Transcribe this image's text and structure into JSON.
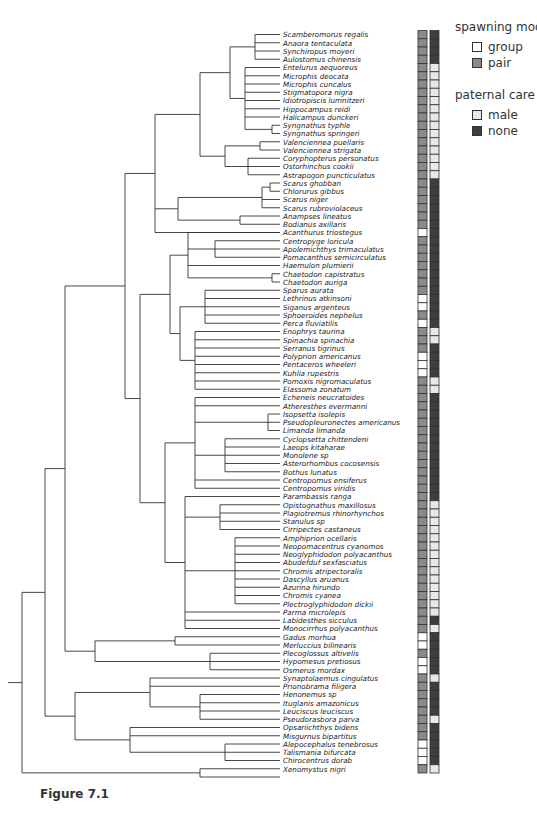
{
  "legend": {
    "spawning_title": "spawning mode",
    "spawning_items": [
      {
        "label": "group",
        "color": "#ffffff"
      },
      {
        "label": "pair",
        "color": "#8a8a8a"
      }
    ],
    "care_title": "paternal care",
    "care_items": [
      {
        "label": "male",
        "color": "#e8e8e8"
      },
      {
        "label": "none",
        "color": "#3d3d3d"
      }
    ]
  },
  "caption": "Figure 7.1",
  "colors": {
    "group": "#ffffff",
    "pair": "#8a8a8a",
    "male": "#e8e8e8",
    "none": "#3d3d3d",
    "line": "#333333"
  },
  "taxa": [
    {
      "name": "Scamberomorus regalis",
      "spawn": "pair",
      "care": "none"
    },
    {
      "name": "Anaora tentaculata",
      "spawn": "pair",
      "care": "none"
    },
    {
      "name": "Synchiropus moyeri",
      "spawn": "pair",
      "care": "none"
    },
    {
      "name": "Aulostomus chinensis",
      "spawn": "pair",
      "care": "none"
    },
    {
      "name": "Entelurus aequoreus",
      "spawn": "pair",
      "care": "male"
    },
    {
      "name": "Microphis deocata",
      "spawn": "pair",
      "care": "male"
    },
    {
      "name": "Microphis cuncalus",
      "spawn": "pair",
      "care": "male"
    },
    {
      "name": "Stigmatopora nigra",
      "spawn": "pair",
      "care": "male"
    },
    {
      "name": "Idiotropiscis lumnitzeri",
      "spawn": "pair",
      "care": "male"
    },
    {
      "name": "Hippocampus reidi",
      "spawn": "pair",
      "care": "male"
    },
    {
      "name": "Halicampus dunckeri",
      "spawn": "pair",
      "care": "male"
    },
    {
      "name": "Syngnathus typhle",
      "spawn": "pair",
      "care": "male"
    },
    {
      "name": "Syngnathus springeri",
      "spawn": "pair",
      "care": "male"
    },
    {
      "name": "Valenciennea puellaris",
      "spawn": "pair",
      "care": "male"
    },
    {
      "name": "Valenciennea strigata",
      "spawn": "pair",
      "care": "male"
    },
    {
      "name": "Coryphopterus personatus",
      "spawn": "pair",
      "care": "male"
    },
    {
      "name": "Ostorhinchus cookii",
      "spawn": "pair",
      "care": "male"
    },
    {
      "name": "Astrapogon puncticulatus",
      "spawn": "pair",
      "care": "male"
    },
    {
      "name": "Scarus ghobban",
      "spawn": "pair",
      "care": "none"
    },
    {
      "name": "Chlorurus gibbus",
      "spawn": "pair",
      "care": "none"
    },
    {
      "name": "Scarus niger",
      "spawn": "pair",
      "care": "none"
    },
    {
      "name": "Scarus rubroviolaceus",
      "spawn": "pair",
      "care": "none"
    },
    {
      "name": "Anampses lineatus",
      "spawn": "pair",
      "care": "none"
    },
    {
      "name": "Bodianus axillaris",
      "spawn": "pair",
      "care": "none"
    },
    {
      "name": "Acanthurus triostegus",
      "spawn": "group",
      "care": "none"
    },
    {
      "name": "Centropyge loricula",
      "spawn": "pair",
      "care": "none"
    },
    {
      "name": "Apolemichthys trimaculatus",
      "spawn": "pair",
      "care": "none"
    },
    {
      "name": "Pomacanthus semicirculatus",
      "spawn": "pair",
      "care": "none"
    },
    {
      "name": "Haemulon plumierii",
      "spawn": "pair",
      "care": "none"
    },
    {
      "name": "Chaetodon capistratus",
      "spawn": "pair",
      "care": "none"
    },
    {
      "name": "Chaetodon auriga",
      "spawn": "pair",
      "care": "none"
    },
    {
      "name": "Sparus aurata",
      "spawn": "pair",
      "care": "none"
    },
    {
      "name": "Lethrinus atkinsoni",
      "spawn": "group",
      "care": "none"
    },
    {
      "name": "Siganus argenteus",
      "spawn": "group",
      "care": "none"
    },
    {
      "name": "Sphoeroides nephelus",
      "spawn": "pair",
      "care": "none"
    },
    {
      "name": "Perca fluviatilis",
      "spawn": "group",
      "care": "none"
    },
    {
      "name": "Enophrys taurina",
      "spawn": "pair",
      "care": "male"
    },
    {
      "name": "Spinachia spinachia",
      "spawn": "pair",
      "care": "male"
    },
    {
      "name": "Serranus tigrinus",
      "spawn": "pair",
      "care": "none"
    },
    {
      "name": "Polyprion americanus",
      "spawn": "group",
      "care": "none"
    },
    {
      "name": "Pentaceros wheeleri",
      "spawn": "group",
      "care": "none"
    },
    {
      "name": "Kuhlia rupestris",
      "spawn": "group",
      "care": "none"
    },
    {
      "name": "Pomoxis nigromaculatus",
      "spawn": "pair",
      "care": "male"
    },
    {
      "name": "Elassoma zonatum",
      "spawn": "pair",
      "care": "male"
    },
    {
      "name": "Echeneis neucratoides",
      "spawn": "pair",
      "care": "none"
    },
    {
      "name": "Atheresthes evermanni",
      "spawn": "pair",
      "care": "none"
    },
    {
      "name": "Isopsetta isolepis",
      "spawn": "pair",
      "care": "none"
    },
    {
      "name": "Pseudopleuronectes americanus",
      "spawn": "pair",
      "care": "none"
    },
    {
      "name": "Limanda limanda",
      "spawn": "pair",
      "care": "none"
    },
    {
      "name": "Cyclopsetta chittendeni",
      "spawn": "pair",
      "care": "none"
    },
    {
      "name": "Laeops kitaharae",
      "spawn": "pair",
      "care": "none"
    },
    {
      "name": "Monolene sp",
      "spawn": "pair",
      "care": "none"
    },
    {
      "name": "Asterorhombus cocosensis",
      "spawn": "pair",
      "care": "none"
    },
    {
      "name": "Bothus lunatus",
      "spawn": "pair",
      "care": "none"
    },
    {
      "name": "Centropomus ensiferus",
      "spawn": "pair",
      "care": "none"
    },
    {
      "name": "Centropomus viridis",
      "spawn": "pair",
      "care": "none"
    },
    {
      "name": "Parambassis ranga",
      "spawn": "pair",
      "care": "none"
    },
    {
      "name": "Opistognathus maxillosus",
      "spawn": "pair",
      "care": "male"
    },
    {
      "name": "Plagiotremus rhinorhynchos",
      "spawn": "pair",
      "care": "male"
    },
    {
      "name": "Stanulus sp",
      "spawn": "pair",
      "care": "male"
    },
    {
      "name": "Cirripectes castaneus",
      "spawn": "pair",
      "care": "male"
    },
    {
      "name": "Amphiprion ocellaris",
      "spawn": "pair",
      "care": "male"
    },
    {
      "name": "Neopomacentrus cyanomos",
      "spawn": "pair",
      "care": "male"
    },
    {
      "name": "Neoglyphidodon polyacanthus",
      "spawn": "pair",
      "care": "male"
    },
    {
      "name": "Abudefduf sexfasciatus",
      "spawn": "pair",
      "care": "male"
    },
    {
      "name": "Chromis atripectoralis",
      "spawn": "pair",
      "care": "male"
    },
    {
      "name": "Dascyllus aruanus",
      "spawn": "pair",
      "care": "male"
    },
    {
      "name": "Azurina hirundo",
      "spawn": "pair",
      "care": "male"
    },
    {
      "name": "Chromis cyanea",
      "spawn": "pair",
      "care": "male"
    },
    {
      "name": "Plectroglyphidodon dickii",
      "spawn": "pair",
      "care": "male"
    },
    {
      "name": "Parma microlepis",
      "spawn": "pair",
      "care": "male"
    },
    {
      "name": "Labidesthes sicculus",
      "spawn": "pair",
      "care": "none"
    },
    {
      "name": "Monocirrhus polyacanthus",
      "spawn": "pair",
      "care": "male"
    },
    {
      "name": "Gadus morhua",
      "spawn": "group",
      "care": "none"
    },
    {
      "name": "Merluccius bilinearis",
      "spawn": "group",
      "care": "none"
    },
    {
      "name": "Plecoglossus altivelis",
      "spawn": "pair",
      "care": "none"
    },
    {
      "name": "Hypomesus pretiosus",
      "spawn": "group",
      "care": "none"
    },
    {
      "name": "Osmerus mordax",
      "spawn": "group",
      "care": "none"
    },
    {
      "name": "Synaptolaemus cingulatus",
      "spawn": "pair",
      "care": "male"
    },
    {
      "name": "Prionobrama filigera",
      "spawn": "pair",
      "care": "none"
    },
    {
      "name": "Henonemus sp",
      "spawn": "pair",
      "care": "none"
    },
    {
      "name": "Ituglanis amazonicus",
      "spawn": "pair",
      "care": "none"
    },
    {
      "name": "Leuciscus leuciscus",
      "spawn": "pair",
      "care": "none"
    },
    {
      "name": "Pseudorasbora parva",
      "spawn": "pair",
      "care": "male"
    },
    {
      "name": "Opsariichthys bidens",
      "spawn": "pair",
      "care": "none"
    },
    {
      "name": "Misgurnus bipartitus",
      "spawn": "pair",
      "care": "none"
    },
    {
      "name": "Alepocephalus tenebrosus",
      "spawn": "group",
      "care": "none"
    },
    {
      "name": "Talismania bifurcata",
      "spawn": "group",
      "care": "none"
    },
    {
      "name": "Chirocentrus dorab",
      "spawn": "group",
      "care": "none"
    },
    {
      "name": "Xenomystus nigri",
      "spawn": "pair",
      "care": "male"
    }
  ]
}
